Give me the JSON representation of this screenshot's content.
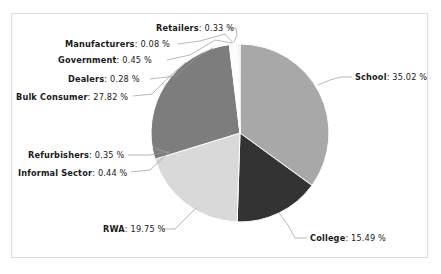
{
  "chart_data": {
    "type": "pie",
    "title": "",
    "xlabel": "",
    "ylabel": "",
    "legend_position": "none",
    "grid": false,
    "value_suffix": "%",
    "label_format": "{name}: {value} %",
    "categories": [
      "School",
      "College",
      "RWA",
      "Bulk Consumer",
      "Dealers",
      "Government",
      "Manufacturers",
      "Retailers",
      "Refurbishers",
      "Informal Sector"
    ],
    "values": [
      35.02,
      15.49,
      19.75,
      27.82,
      0.28,
      0.45,
      0.08,
      0.33,
      0.35,
      0.44
    ],
    "slices": [
      {
        "name": "School",
        "value": 35.02,
        "label": "School: 35.02 %",
        "color": "#a8a8a8",
        "start_angle": 0,
        "sweep": 126.07
      },
      {
        "name": "College",
        "value": 15.49,
        "label": "College: 15.49 %",
        "color": "#333333",
        "start_angle": 126.07,
        "sweep": 55.76
      },
      {
        "name": "RWA",
        "value": 19.75,
        "label": "RWA: 19.75 %",
        "color": "#d9d9d9",
        "start_angle": 181.83,
        "sweep": 71.1
      },
      {
        "name": "Bulk Consumer",
        "value": 27.82,
        "label": "Bulk Consumer: 27.82 %",
        "color": "#7d7d7d",
        "start_angle": 252.93,
        "sweep": 100.15
      },
      {
        "name": "Dealers",
        "value": 0.28,
        "label": "Dealers: 0.28 %",
        "color": "#f2f2f2",
        "start_angle": 353.08,
        "sweep": 1.01
      },
      {
        "name": "Government",
        "value": 0.45,
        "label": "Government: 0.45 %",
        "color": "#fbfbfb",
        "start_angle": 354.09,
        "sweep": 1.62
      },
      {
        "name": "Manufacturers",
        "value": 0.08,
        "label": "Manufacturers: 0.08 %",
        "color": "#ededed",
        "start_angle": 355.71,
        "sweep": 0.29
      },
      {
        "name": "Retailers",
        "value": 0.33,
        "label": "Retailers: 0.33 %",
        "color": "#f7f7f7",
        "start_angle": 356.0,
        "sweep": 1.19
      },
      {
        "name": "Refurbishers",
        "value": 0.35,
        "label": "Refurbishers: 0.35 %",
        "color": "#fafafa",
        "start_angle": 357.19,
        "sweep": 1.26
      },
      {
        "name": "Informal Sector",
        "value": 0.44,
        "label": "Informal Sector: 0.44 %",
        "color": "#f0f0f0",
        "start_angle": 358.45,
        "sweep": 1.58
      }
    ]
  },
  "labels": {
    "retailers": {
      "name": "Retailers",
      "value": "0.33 %"
    },
    "manufacturers": {
      "name": "Manufacturers",
      "value": "0.08 %"
    },
    "government": {
      "name": "Government",
      "value": "0.45 %"
    },
    "dealers": {
      "name": "Dealers",
      "value": "0.28 %"
    },
    "bulk_consumer": {
      "name": "Bulk Consumer",
      "value": "27.82 %"
    },
    "refurbishers": {
      "name": "Refurbishers",
      "value": "0.35 %"
    },
    "informal_sector": {
      "name": "Informal Sector",
      "value": "0.44 %"
    },
    "rwa": {
      "name": "RWA",
      "value": "19.75 %"
    },
    "college": {
      "name": "College",
      "value": "15.49 %"
    },
    "school": {
      "name": "School",
      "value": "35.02 %"
    }
  },
  "separator": ":"
}
